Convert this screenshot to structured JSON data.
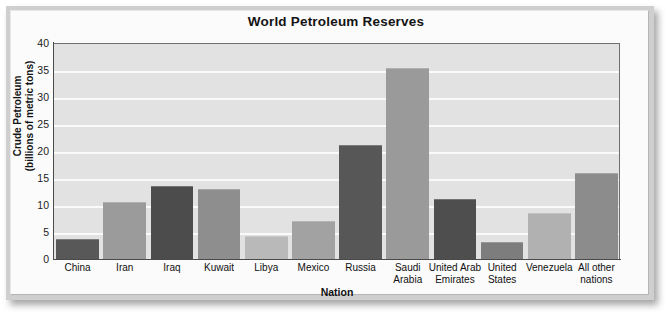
{
  "chart_data": {
    "type": "bar",
    "title": "World Petroleum Reserves",
    "xlabel": "Nation",
    "ylabel": "Crude Petroleum (billions of metric tons)",
    "ylabel_line1": "Crude Petroleum",
    "ylabel_line2": "(billions of metric tons)",
    "ylim": [
      0,
      40
    ],
    "ytick_labels": [
      "40",
      "35",
      "30",
      "25",
      "20",
      "15",
      "10",
      "5",
      "0"
    ],
    "ytick_values": [
      40,
      35,
      30,
      25,
      20,
      15,
      10,
      5,
      0
    ],
    "grid": "horizontal",
    "legend": "none",
    "categories": [
      "China",
      "Iran",
      "Iraq",
      "Kuwait",
      "Libya",
      "Mexico",
      "Russia",
      "Saudi Arabia",
      "United Arab Emirates",
      "United States",
      "Venezuela",
      "All other nations"
    ],
    "category_lines": [
      [
        "China"
      ],
      [
        "Iran"
      ],
      [
        "Iraq"
      ],
      [
        "Kuwait"
      ],
      [
        "Libya"
      ],
      [
        "Mexico"
      ],
      [
        "Russia"
      ],
      [
        "Saudi",
        "Arabia"
      ],
      [
        "United Arab",
        "Emirates"
      ],
      [
        "United",
        "States"
      ],
      [
        "Venezuela"
      ],
      [
        "All other",
        "nations"
      ]
    ],
    "values": [
      3.5,
      10.3,
      13.3,
      12.8,
      4.1,
      6.8,
      21.0,
      35.2,
      10.9,
      3.0,
      8.3,
      15.8
    ],
    "bar_colors": [
      "#585858",
      "#9b9b9b",
      "#4c4c4c",
      "#8e8e8e",
      "#b9b9b9",
      "#a2a2a2",
      "#575757",
      "#9a9a9a",
      "#4e4e4e",
      "#7d7d7d",
      "#b1b1b1",
      "#8c8c8c"
    ]
  },
  "colors": {
    "plot_background": "#e2e2e2",
    "gridline": "#fafafa",
    "axis": "#4a4a4a",
    "frame": "#cfcfcf",
    "page_background": "#fbfbfb",
    "text": "#101010"
  }
}
